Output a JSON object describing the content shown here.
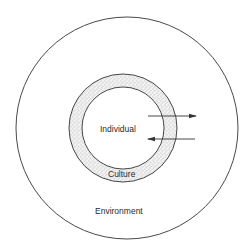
{
  "diagram": {
    "type": "nested-circles",
    "labels": {
      "inner": "Individual",
      "ring": "Culture",
      "outer": "Environment"
    },
    "arrows": [
      {
        "direction": "outward",
        "from": "Individual",
        "to": "Environment"
      },
      {
        "direction": "inward",
        "from": "Environment",
        "to": "Individual"
      }
    ],
    "colors": {
      "stroke": "#333333",
      "ring_fill": "#e6e6e6",
      "background": "#ffffff"
    }
  }
}
